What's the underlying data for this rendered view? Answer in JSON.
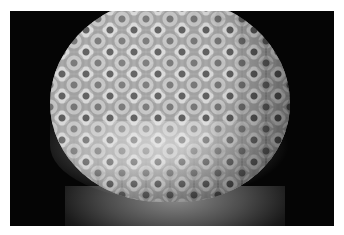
{
  "photo": {
    "subject": "coral head",
    "palette": {
      "background": "#050505",
      "coral_light": "#e8e8e8",
      "coral_mid": "#9a9a9a",
      "coral_dark": "#3a3a3a"
    }
  },
  "caption": {
    "text": ""
  }
}
